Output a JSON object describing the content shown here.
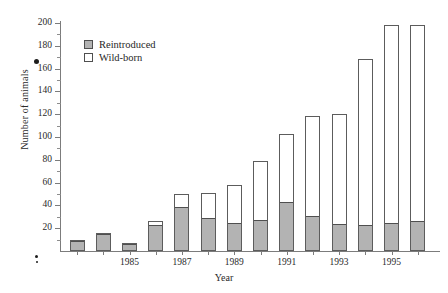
{
  "chart_data": {
    "type": "bar",
    "title": "",
    "xlabel": "Year",
    "ylabel": "Number of animals",
    "ylim": [
      0,
      200
    ],
    "ytick_labels": [
      "20",
      "40",
      "60",
      "80",
      "100",
      "120",
      "140",
      "160",
      "180",
      "200"
    ],
    "ytick_values": [
      20,
      40,
      60,
      80,
      100,
      120,
      140,
      160,
      180,
      200
    ],
    "grid": false,
    "stacked": true,
    "legend_position": "top-left",
    "categories": [
      "1983",
      "1984",
      "1985",
      "1986",
      "1987",
      "1988",
      "1989",
      "1990",
      "1991",
      "1992",
      "1993",
      "1994",
      "1995",
      "1996"
    ],
    "xtick_labels": [
      "1985",
      "1987",
      "1989",
      "1991",
      "1993",
      "1995"
    ],
    "series": [
      {
        "name": "Reintroduced",
        "color": "#b3b3b3",
        "values": [
          8,
          14,
          5,
          22,
          38,
          28,
          24,
          26,
          42,
          30,
          23,
          22,
          24,
          25
        ]
      },
      {
        "name": "Wild-born",
        "color": "#ffffff",
        "values": [
          2,
          2,
          2,
          4,
          12,
          23,
          34,
          53,
          61,
          88,
          97,
          146,
          174,
          173
        ]
      }
    ],
    "totals": [
      10,
      16,
      7,
      26,
      50,
      51,
      58,
      79,
      103,
      118,
      120,
      168,
      198,
      198
    ]
  },
  "legend": {
    "items": [
      {
        "label": "Reintroduced",
        "swatch": "gray"
      },
      {
        "label": "Wild-born",
        "swatch": "white"
      }
    ]
  }
}
